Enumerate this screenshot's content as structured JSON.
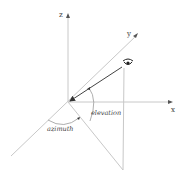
{
  "diagram": {
    "title": "",
    "axes": {
      "x_label": "x",
      "y_label": "y",
      "z_label": "z"
    },
    "angles": {
      "elevation_label": "elevation",
      "azimuth_label": "azimuth"
    },
    "viewer": {
      "icon": "eye-icon"
    },
    "colors": {
      "axis": "#c8c8c8",
      "view_line": "#444444",
      "text": "#333333"
    }
  }
}
